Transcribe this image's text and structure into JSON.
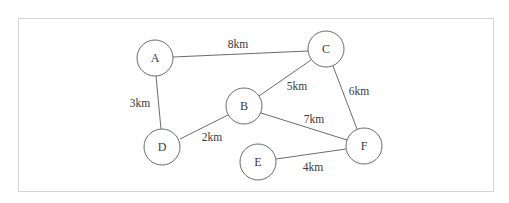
{
  "diagram": {
    "type": "weighted-undirected-graph",
    "nodes": [
      {
        "id": "A",
        "label": "A",
        "x": 155,
        "y": 58
      },
      {
        "id": "B",
        "label": "B",
        "x": 244,
        "y": 106
      },
      {
        "id": "C",
        "label": "C",
        "x": 326,
        "y": 49
      },
      {
        "id": "D",
        "label": "D",
        "x": 162,
        "y": 147
      },
      {
        "id": "E",
        "label": "E",
        "x": 258,
        "y": 162
      },
      {
        "id": "F",
        "label": "F",
        "x": 364,
        "y": 146
      }
    ],
    "edges": [
      {
        "from": "A",
        "to": "C",
        "weight": "8km",
        "label_x": 238,
        "label_y": 44
      },
      {
        "from": "A",
        "to": "D",
        "weight": "3km",
        "label_x": 140,
        "label_y": 103
      },
      {
        "from": "D",
        "to": "B",
        "weight": "2km",
        "label_x": 212,
        "label_y": 137
      },
      {
        "from": "B",
        "to": "C",
        "weight": "5km",
        "label_x": 297,
        "label_y": 86
      },
      {
        "from": "B",
        "to": "F",
        "weight": "7km",
        "label_x": 314,
        "label_y": 119
      },
      {
        "from": "C",
        "to": "F",
        "weight": "6km",
        "label_x": 359,
        "label_y": 91
      },
      {
        "from": "E",
        "to": "F",
        "weight": "4km",
        "label_x": 313,
        "label_y": 167
      }
    ]
  },
  "nodes": {
    "A": "A",
    "B": "B",
    "C": "C",
    "D": "D",
    "E": "E",
    "F": "F"
  },
  "edge_labels": {
    "A_C": "8km",
    "A_D": "3km",
    "D_B": "2km",
    "B_C": "5km",
    "B_F": "7km",
    "C_F": "6km",
    "E_F": "4km"
  },
  "colors": {
    "stroke": "#6b6b6b",
    "text": "#3a3a3a",
    "frame": "#d4d4d4",
    "background": "#ffffff"
  }
}
